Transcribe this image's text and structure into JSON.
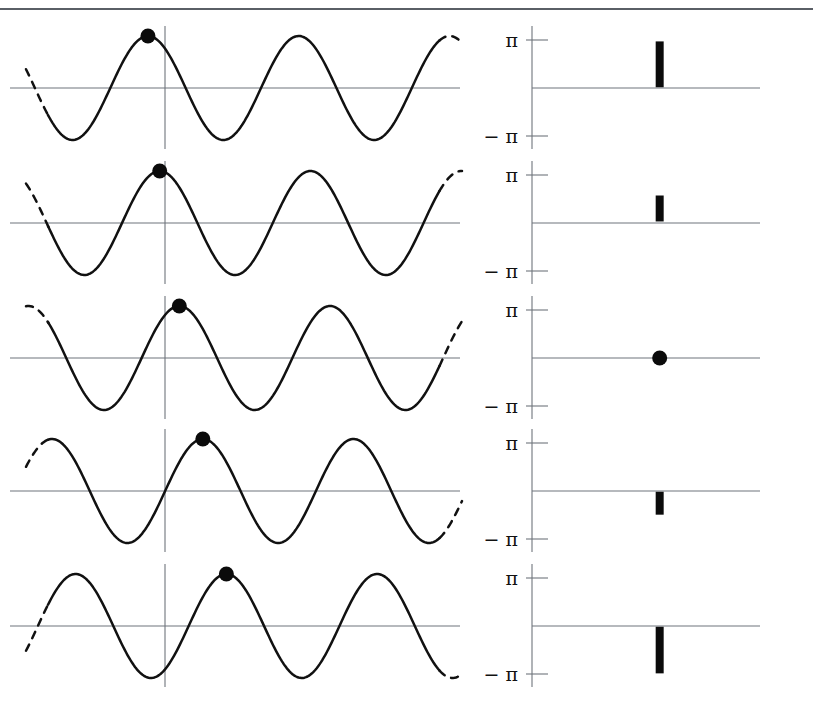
{
  "figure": {
    "kind": "phase-estimation-figure",
    "rows": 5,
    "top_rule": true
  },
  "axis": {
    "tick_top_label": "π",
    "tick_bottom_label": "− π",
    "tick_top_value": 3.14159,
    "tick_bottom_value": -3.14159,
    "zero_value": 0
  },
  "colors": {
    "curve": "#111111",
    "axis": "#6f757c",
    "marker": "#0b0b0b",
    "rule": "#5a5f66",
    "background": "#ffffff"
  },
  "chart_data": {
    "type": "line",
    "title": "",
    "subtitle": "",
    "xlabel": "",
    "ylabel": "",
    "grid": false,
    "legend": "none",
    "panels": [
      {
        "row": 1,
        "left": {
          "type": "sinusoid",
          "amplitude": 1.0,
          "cycles": 2.6,
          "phase_label": "π",
          "phase_value": 3.14159,
          "marker": {
            "name": "peak-marker",
            "x_norm": 0.255,
            "y_norm": 1.0
          },
          "dashed_ends": [
            "left",
            "right"
          ]
        },
        "right": {
          "type": "phase-spike",
          "center": 1.55,
          "low": 0.05,
          "high": 3.05,
          "x_norm": 0.56,
          "shape": "bar"
        }
      },
      {
        "row": 2,
        "left": {
          "type": "sinusoid",
          "amplitude": 1.0,
          "cycles": 2.6,
          "phase_label": "π/2",
          "phase_value": 1.5708,
          "marker": {
            "name": "peak-marker",
            "x_norm": 0.285,
            "y_norm": 1.0
          },
          "dashed_ends": [
            "left",
            "right"
          ]
        },
        "right": {
          "type": "phase-spike",
          "center": 0.95,
          "low": 0.1,
          "high": 1.8,
          "x_norm": 0.56,
          "shape": "bar"
        }
      },
      {
        "row": 3,
        "left": {
          "type": "sinusoid",
          "amplitude": 1.0,
          "cycles": 2.6,
          "phase_label": "0",
          "phase_value": 0,
          "marker": {
            "name": "peak-marker",
            "x_norm": 0.335,
            "y_norm": 1.0
          },
          "dashed_ends": [
            "left",
            "right"
          ]
        },
        "right": {
          "type": "phase-point",
          "center": 0,
          "low": 0,
          "high": 0,
          "x_norm": 0.56,
          "shape": "dot"
        }
      },
      {
        "row": 4,
        "left": {
          "type": "sinusoid",
          "amplitude": 1.0,
          "cycles": 2.6,
          "phase_label": "−π/2",
          "phase_value": -1.5708,
          "marker": {
            "name": "peak-marker",
            "x_norm": 0.395,
            "y_norm": 1.0
          },
          "dashed_ends": [
            "left",
            "right"
          ]
        },
        "right": {
          "type": "phase-spike",
          "center": -0.75,
          "low": -1.55,
          "high": -0.05,
          "x_norm": 0.56,
          "shape": "bar"
        }
      },
      {
        "row": 5,
        "left": {
          "type": "sinusoid",
          "amplitude": 1.0,
          "cycles": 2.6,
          "phase_label": "−π",
          "phase_value": -3.14159,
          "marker": {
            "name": "peak-marker",
            "x_norm": 0.455,
            "y_norm": 1.0
          },
          "dashed_ends": [
            "left",
            "right"
          ]
        },
        "right": {
          "type": "phase-spike",
          "center": -1.6,
          "low": -3.1,
          "high": -0.05,
          "x_norm": 0.56,
          "shape": "bar"
        }
      }
    ]
  }
}
